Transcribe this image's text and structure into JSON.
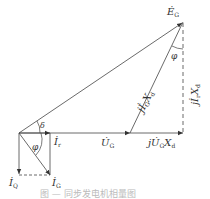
{
  "diagram": {
    "type": "phasor-diagram",
    "labels": {
      "EG": "Ė",
      "EG_sub": "G",
      "phi_top": "φ",
      "jIGXd_main": "jİ",
      "jIGXd_sub1": "G",
      "jIGXd_X": "X",
      "jIGXd_sub2": "d",
      "jIrXd_main": "jİ",
      "jIrXd_sub1": "r",
      "jIrXd_X": "X",
      "jIrXd_sub2": "d",
      "delta": "δ",
      "phi_bottom": "φ",
      "Ir": "İ",
      "Ir_sub": "r",
      "UG": "U̇",
      "UG_sub": "G",
      "jUGXd_main": "jU̇",
      "jUGXd_sub1": "G",
      "jUGXd_X": "X",
      "jUGXd_sub2": "d",
      "IQ": "İ",
      "IQ_sub": "Q",
      "IG": "İ",
      "IG_sub": "G"
    },
    "caption": "图 — 同步发电机相量图"
  }
}
